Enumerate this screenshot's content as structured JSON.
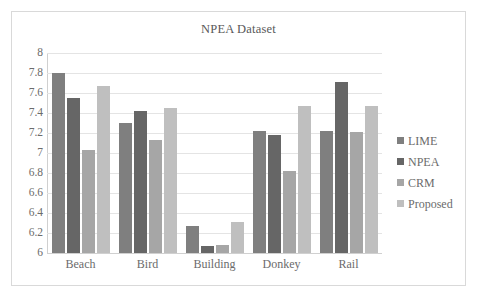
{
  "chart_data": {
    "type": "bar",
    "title": "NPEA Dataset",
    "xlabel": "",
    "ylabel": "",
    "ylim": [
      6,
      8
    ],
    "ytick_labels": [
      "8",
      "7.8",
      "7.6",
      "7.4",
      "7.2",
      "7",
      "6.8",
      "6.6",
      "6.4",
      "6.2",
      "6"
    ],
    "ytick_values": [
      8,
      7.8,
      7.6,
      7.4,
      7.2,
      7,
      6.8,
      6.6,
      6.4,
      6.2,
      6
    ],
    "grid": true,
    "legend_position": "right",
    "categories": [
      "Beach",
      "Bird",
      "Building",
      "Donkey",
      "Rail"
    ],
    "series": [
      {
        "name": "LIME",
        "color": "#7f7f7f",
        "values": [
          7.8,
          7.3,
          6.27,
          7.22,
          7.22
        ]
      },
      {
        "name": "NPEA",
        "color": "#666666",
        "values": [
          7.55,
          7.42,
          6.07,
          7.18,
          7.71
        ]
      },
      {
        "name": "CRM",
        "color": "#a6a6a6",
        "values": [
          7.03,
          7.13,
          6.08,
          6.82,
          7.21
        ]
      },
      {
        "name": "Proposed",
        "color": "#bfbfbf",
        "values": [
          7.67,
          7.45,
          6.31,
          7.47,
          7.47
        ]
      }
    ]
  },
  "colors": {
    "frame_border": "#d9d9d9",
    "gridline": "#e4e4e4",
    "axis": "#d0d0d0",
    "text": "#6b6b6b",
    "title_text": "#595959"
  }
}
